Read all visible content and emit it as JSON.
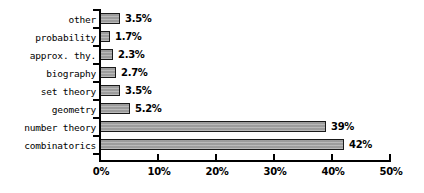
{
  "chart_data": {
    "type": "bar",
    "orientation": "horizontal",
    "title": "",
    "subtitle": "",
    "xlabel": "",
    "ylabel": "",
    "xlim": [
      0,
      50
    ],
    "grid": false,
    "legend": null,
    "categories": [
      "other",
      "probability",
      "approx. thy.",
      "biography",
      "set theory",
      "geometry",
      "number theory",
      "combinatorics"
    ],
    "values": [
      3.5,
      1.7,
      2.3,
      2.7,
      3.5,
      5.2,
      39,
      42
    ],
    "data_labels": [
      "3.5%",
      "1.7%",
      "2.3%",
      "2.7%",
      "3.5%",
      "5.2%",
      "39%",
      "42%"
    ],
    "xticks": [
      0,
      10,
      20,
      30,
      40,
      50
    ],
    "xtick_labels": [
      "0%",
      "10%",
      "20%",
      "30%",
      "40%",
      "50%"
    ],
    "colors": {
      "bar_fill": "#a6a6a6",
      "bar_border": "#1a1a1a",
      "axis": "#000000",
      "text": "#000000",
      "background": "#ffffff"
    }
  }
}
